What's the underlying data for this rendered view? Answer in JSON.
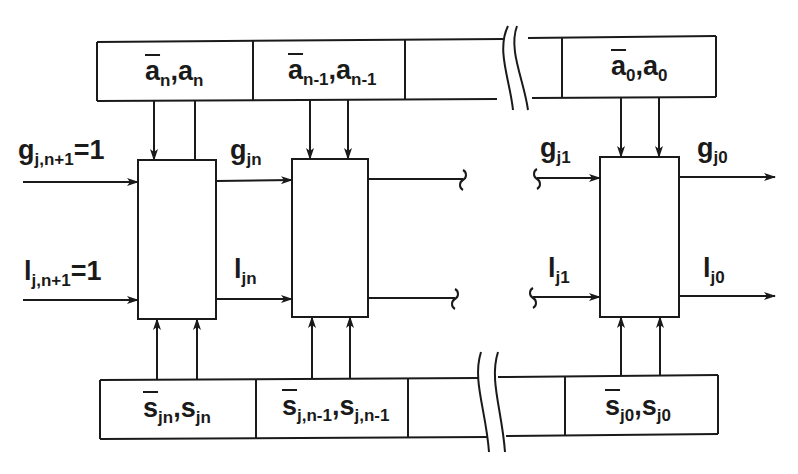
{
  "diagram": {
    "register_a": {
      "cells": [
        {
          "bar": "a",
          "sub": "n",
          "plain": "a",
          "plain_sub": "n"
        },
        {
          "bar": "a",
          "sub": "n-1",
          "plain": "a",
          "plain_sub": "n-1"
        },
        {
          "empty": true
        },
        {
          "bar": "a",
          "sub": "0",
          "plain": "a",
          "plain_sub": "0"
        }
      ]
    },
    "register_s": {
      "cells": [
        {
          "bar": "s",
          "sub": "jn",
          "plain": "s",
          "plain_sub": "jn"
        },
        {
          "bar": "s",
          "sub": "j,n-1",
          "plain": "s",
          "plain_sub": "j,n-1"
        },
        {
          "empty": true
        },
        {
          "bar": "s",
          "sub": "j0",
          "plain": "s",
          "plain_sub": "j0"
        }
      ]
    },
    "signals": {
      "g_in": {
        "base": "g",
        "sub": "j,n+1",
        "suffix": "=1"
      },
      "l_in": {
        "base": "l",
        "sub": "j,n+1",
        "suffix": "=1"
      },
      "g_jn": {
        "base": "g",
        "sub": "jn"
      },
      "l_jn": {
        "base": "l",
        "sub": "jn"
      },
      "g_j1": {
        "base": "g",
        "sub": "j1"
      },
      "l_j1": {
        "base": "l",
        "sub": "j1"
      },
      "g_j0": {
        "base": "g",
        "sub": "j0"
      },
      "l_j0": {
        "base": "l",
        "sub": "j0"
      }
    },
    "stroke_color": "#1a1a1a"
  }
}
